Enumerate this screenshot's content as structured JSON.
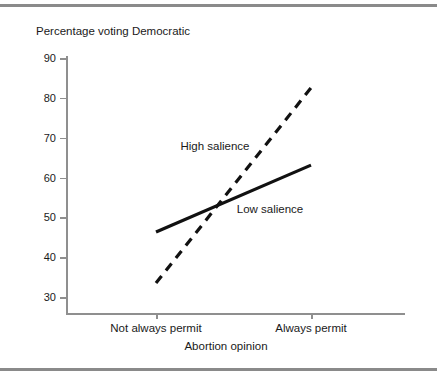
{
  "figure": {
    "title": "Percentage voting Democratic",
    "border_color": "#8a8a8a",
    "background": "#ffffff"
  },
  "chart_data": {
    "type": "line",
    "title": "Percentage voting Democratic",
    "xlabel": "Abortion opinion",
    "ylabel": "Percentage voting Democratic",
    "categories": [
      "Not always permit",
      "Always permit"
    ],
    "x_tick_labels": [
      "Not always permit",
      "Always permit"
    ],
    "y_tick_labels": [
      "90",
      "80",
      "70",
      "60",
      "50",
      "40",
      "30"
    ],
    "y_ticks": [
      90,
      80,
      70,
      60,
      50,
      40,
      30
    ],
    "ylim": [
      28,
      90
    ],
    "grid": false,
    "legend_position": "inline-annotation",
    "series": [
      {
        "name": "High salience",
        "style": "dashed",
        "color": "#111111",
        "values": [
          33.5,
          82.5
        ],
        "label_x_category_fraction": 0.38,
        "label_value": 69.5
      },
      {
        "name": "Low salience",
        "style": "solid",
        "color": "#111111",
        "values": [
          46.3,
          63.1
        ],
        "label_x_category_fraction": 0.74,
        "label_value": 53.5
      }
    ],
    "annotations": [
      {
        "text": "High salience",
        "series": "High salience"
      },
      {
        "text": "Low salience",
        "series": "Low salience"
      }
    ]
  },
  "axes": {
    "x_title": "Abortion opinion",
    "axis_color": "#8f8f8f"
  }
}
